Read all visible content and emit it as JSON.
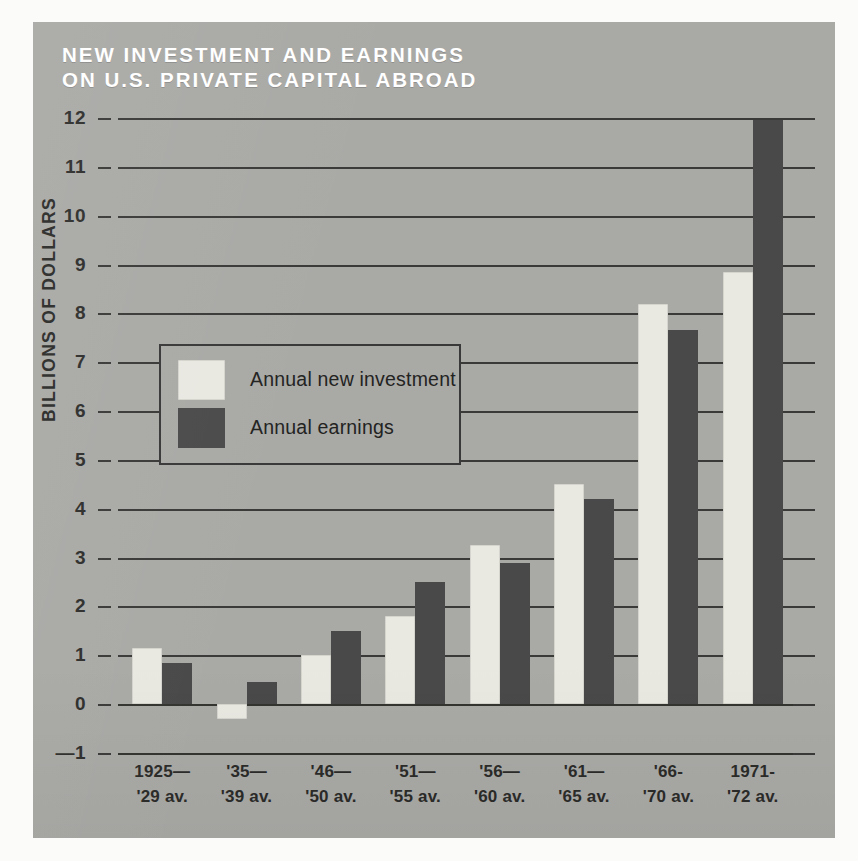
{
  "title": {
    "line1": "NEW INVESTMENT AND EARNINGS",
    "line2": "ON U.S. PRIVATE CAPITAL ABROAD"
  },
  "colors": {
    "panel_background": "#a9a9a6",
    "light_bar": "#e9e8e1",
    "dark_bar": "#49494a",
    "axis_line": "#3a3a38",
    "title_text": "#ffffff",
    "label_text": "#2b2b29"
  },
  "axes": {
    "y_title": "BILLIONS OF DOLLARS",
    "y_ticks": [
      "12",
      "11",
      "10",
      "9",
      "8",
      "7",
      "6",
      "5",
      "4",
      "3",
      "2",
      "1",
      "0",
      "—1"
    ]
  },
  "legend": {
    "entries": [
      {
        "label": "Annual new investment",
        "color": "#e9e8e1"
      },
      {
        "label": "Annual  earnings",
        "color": "#49494a"
      }
    ]
  },
  "chart_data": {
    "type": "bar",
    "title": "NEW INVESTMENT AND EARNINGS ON U.S. PRIVATE CAPITAL ABROAD",
    "xlabel": "",
    "ylabel": "BILLIONS OF DOLLARS",
    "ylim": [
      -1,
      12
    ],
    "yticks": [
      -1,
      0,
      1,
      2,
      3,
      4,
      5,
      6,
      7,
      8,
      9,
      10,
      11,
      12
    ],
    "grid": true,
    "legend_position": "inside-left",
    "categories": [
      "1925— '29 av.",
      "'35— '39 av.",
      "'46— '50 av.",
      "'51— '55 av.",
      "'56— '60 av.",
      "'61— '65 av.",
      "'66- '70 av.",
      "1971- '72 av."
    ],
    "category_lines": [
      [
        "1925—",
        "'29 av."
      ],
      [
        "'35—",
        "'39 av."
      ],
      [
        "'46—",
        "'50 av."
      ],
      [
        "'51—",
        "'55 av."
      ],
      [
        "'56—",
        "'60 av."
      ],
      [
        "'61—",
        "'65 av."
      ],
      [
        "'66-",
        "'70 av."
      ],
      [
        "1971-",
        "'72 av."
      ]
    ],
    "series": [
      {
        "name": "Annual new investment",
        "color": "#e9e8e1",
        "values": [
          1.15,
          -0.3,
          1.0,
          1.8,
          3.25,
          4.5,
          8.2,
          8.85
        ]
      },
      {
        "name": "Annual earnings",
        "color": "#49494a",
        "values": [
          0.85,
          0.45,
          1.5,
          2.5,
          2.9,
          4.2,
          7.65,
          11.95
        ]
      }
    ]
  }
}
